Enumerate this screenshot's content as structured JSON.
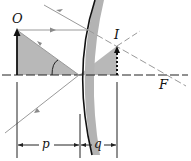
{
  "diagram": {
    "labels": {
      "object": "O",
      "image": "I",
      "focal_point": "F",
      "object_distance": "p",
      "image_distance": "q"
    },
    "colors": {
      "ray": "#9a9a9a",
      "axis": "#222222",
      "triangle_fill": "#b5b5b5",
      "mirror_front": "#111111",
      "mirror_back": "#b0b0b0",
      "arrow": "#111111"
    }
  }
}
